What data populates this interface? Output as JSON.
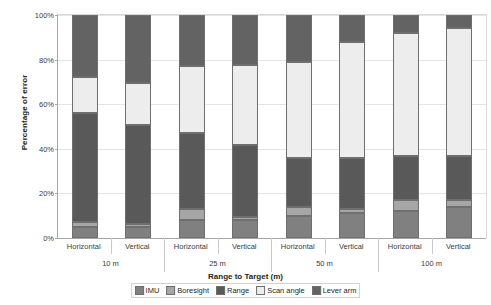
{
  "chart_data": {
    "type": "bar",
    "subtype": "stacked-bar-100-percent",
    "title": "",
    "xlabel": "Range to Target (m)",
    "ylabel": "Percentage of error",
    "ylim": [
      0,
      100
    ],
    "ytick_labels": [
      "0%",
      "20%",
      "40%",
      "60%",
      "80%",
      "100%"
    ],
    "ytick_values": [
      0,
      20,
      40,
      60,
      80,
      100
    ],
    "grid": true,
    "legend_position": "bottom",
    "group_labels": [
      "10 m",
      "25 m",
      "50 m",
      "100 m"
    ],
    "categories": [
      "Horizontal",
      "Vertical",
      "Horizontal",
      "Vertical",
      "Horizontal",
      "Vertical",
      "Horizontal",
      "Vertical"
    ],
    "series": [
      {
        "name": "IMU",
        "color": "#808080",
        "values": [
          5,
          5,
          8,
          8,
          10,
          11,
          12,
          14
        ]
      },
      {
        "name": "Boresight",
        "color": "#a6a6a6",
        "values": [
          2,
          1.5,
          5,
          1.5,
          4,
          2,
          5,
          3
        ]
      },
      {
        "name": "Range",
        "color": "#595959",
        "values": [
          49,
          44,
          34,
          32,
          22,
          23,
          20,
          20
        ]
      },
      {
        "name": "Scan angle",
        "color": "#ededed",
        "values": [
          16,
          19,
          30,
          36,
          43,
          52,
          55,
          57
        ]
      },
      {
        "name": "Lever arm",
        "color": "#636363",
        "values": [
          28,
          30.5,
          23,
          22.5,
          21,
          12,
          8,
          6
        ]
      }
    ]
  },
  "legend": {
    "items": [
      {
        "label": "IMU"
      },
      {
        "label": "Boresight"
      },
      {
        "label": "Range"
      },
      {
        "label": "Scan angle"
      },
      {
        "label": "Lever arm"
      }
    ]
  }
}
